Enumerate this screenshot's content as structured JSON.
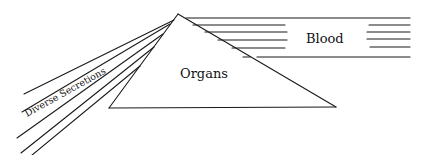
{
  "diagram": {
    "labels": {
      "blood": "Blood",
      "organs": "Organs",
      "secretions": "Diverse Secretions"
    },
    "colors": {
      "ink": "#1a1a1a",
      "background": "#ffffff"
    }
  }
}
